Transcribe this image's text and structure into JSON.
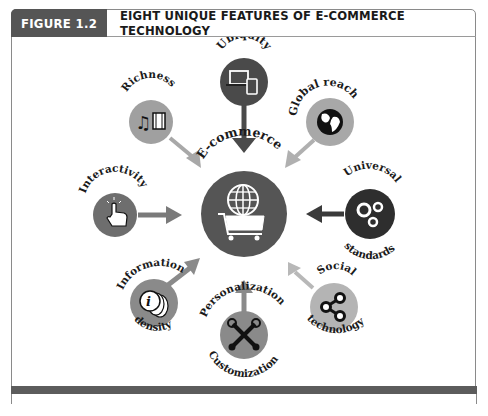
{
  "header": {
    "figure_label": "FIGURE 1.2",
    "title": "EIGHT UNIQUE FEATURES OF E-COMMERCE TECHNOLOGY"
  },
  "center": {
    "label": "E-commerce",
    "icon": "globe-shopping-cart-icon",
    "color": "#555555"
  },
  "features": [
    {
      "id": "ubiquity",
      "label": "Ubiquity",
      "label2": "",
      "icon": "laptop-tablet-icon",
      "circle_color": "#4a4a4a",
      "arrow_color": "#4a4a4a"
    },
    {
      "id": "global-reach",
      "label": "Global reach",
      "label2": "",
      "icon": "globe-icon",
      "circle_color": "#a8a8a8",
      "arrow_color": "#b0b0b0"
    },
    {
      "id": "universal-standards",
      "label": "Universal",
      "label2": "standards",
      "icon": "gears-icon",
      "circle_color": "#2e2e2e",
      "arrow_color": "#3a3a3a"
    },
    {
      "id": "social-technology",
      "label": "Social",
      "label2": "technology",
      "icon": "share-icon",
      "circle_color": "#b4b4b4",
      "arrow_color": "#b8b8b8"
    },
    {
      "id": "personalization",
      "label": "Personalization",
      "label2": "Customization",
      "icon": "wrenches-icon",
      "circle_color": "#8a8a8a",
      "arrow_color": "#8a8a8a"
    },
    {
      "id": "information-density",
      "label": "Information",
      "label2": "density",
      "icon": "info-coins-icon",
      "circle_color": "#8a8a8a",
      "arrow_color": "#8a8a8a"
    },
    {
      "id": "interactivity",
      "label": "Interactivity",
      "label2": "",
      "icon": "pointer-hand-icon",
      "circle_color": "#6e6e6e",
      "arrow_color": "#7a7a7a"
    },
    {
      "id": "richness",
      "label": "Richness",
      "label2": "",
      "icon": "music-film-icon",
      "circle_color": "#a0a0a0",
      "arrow_color": "#a8a8a8"
    }
  ],
  "colors": {
    "header_bg": "#555555",
    "bottom_bar": "#5c5c5c",
    "border": "#8a8a8a"
  }
}
